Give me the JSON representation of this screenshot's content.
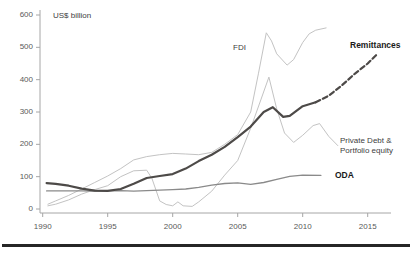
{
  "chart_title": "US$ billion",
  "labels": {
    "fdi": "FDI",
    "remittances": "Remittances",
    "private_debt_line1": "Private Debt &",
    "private_debt_line2": "Portfolio equity",
    "oda": "ODA"
  },
  "colors": {
    "light_series": "#c3c3c3",
    "oda_series": "#8a8a8a",
    "remittances_series": "#4d4a48",
    "axis": "#a6a6a6",
    "tick_text": "#595959",
    "bottom_rule": "#262626"
  },
  "chart_data": {
    "type": "line",
    "title": "US$ billion",
    "xlabel": "",
    "ylabel": "US$ billion",
    "xlim": [
      1989.5,
      2016.5
    ],
    "ylim": [
      0,
      600
    ],
    "y_ticks": [
      0,
      100,
      200,
      300,
      400,
      500,
      600
    ],
    "x_ticks": [
      1990,
      1995,
      2000,
      2005,
      2010,
      2015
    ],
    "grid": false,
    "legend_position": "inline-labels",
    "series": [
      {
        "name": "FDI",
        "style": "solid",
        "color": "#c3c3c3",
        "width": 1,
        "points": [
          [
            1990.4,
            15
          ],
          [
            1991,
            25
          ],
          [
            1992,
            42
          ],
          [
            1993,
            62
          ],
          [
            1994,
            82
          ],
          [
            1995,
            102
          ],
          [
            1996,
            125
          ],
          [
            1997,
            152
          ],
          [
            1998,
            162
          ],
          [
            1999,
            168
          ],
          [
            2000,
            172
          ],
          [
            2001,
            170
          ],
          [
            2002,
            168
          ],
          [
            2003,
            175
          ],
          [
            2004,
            200
          ],
          [
            2005,
            230
          ],
          [
            2006,
            300
          ],
          [
            2006.6,
            420
          ],
          [
            2007.2,
            545
          ],
          [
            2007.6,
            520
          ],
          [
            2008,
            480
          ],
          [
            2008.8,
            445
          ],
          [
            2009.3,
            462
          ],
          [
            2010,
            515
          ],
          [
            2010.5,
            542
          ],
          [
            2011,
            553
          ],
          [
            2011.8,
            560
          ]
        ]
      },
      {
        "name": "Private Debt & Portfolio equity",
        "style": "solid",
        "color": "#c3c3c3",
        "width": 1,
        "points": [
          [
            1990.4,
            10
          ],
          [
            1991,
            15
          ],
          [
            1992,
            28
          ],
          [
            1993,
            46
          ],
          [
            1994,
            60
          ],
          [
            1995,
            72
          ],
          [
            1996,
            100
          ],
          [
            1997,
            118
          ],
          [
            1998,
            120
          ],
          [
            1998.4,
            95
          ],
          [
            1999,
            25
          ],
          [
            1999.5,
            14
          ],
          [
            2000,
            10
          ],
          [
            2000.4,
            22
          ],
          [
            2000.8,
            10
          ],
          [
            2001.5,
            8
          ],
          [
            2002,
            22
          ],
          [
            2003,
            55
          ],
          [
            2004,
            105
          ],
          [
            2005,
            150
          ],
          [
            2006,
            250
          ],
          [
            2006.8,
            340
          ],
          [
            2007.4,
            408
          ],
          [
            2008,
            310
          ],
          [
            2008.6,
            235
          ],
          [
            2009.3,
            206
          ],
          [
            2010,
            228
          ],
          [
            2010.8,
            258
          ],
          [
            2011.3,
            264
          ],
          [
            2012,
            225
          ],
          [
            2012.7,
            196
          ]
        ]
      },
      {
        "name": "ODA",
        "style": "solid",
        "color": "#8a8a8a",
        "width": 1.3,
        "points": [
          [
            1990.3,
            56
          ],
          [
            1991,
            56
          ],
          [
            1992,
            56
          ],
          [
            1993,
            56
          ],
          [
            1994,
            55
          ],
          [
            1995,
            56
          ],
          [
            1996,
            57
          ],
          [
            1997,
            55
          ],
          [
            1998,
            57
          ],
          [
            1999,
            58
          ],
          [
            2000,
            60
          ],
          [
            2001,
            62
          ],
          [
            2002,
            67
          ],
          [
            2003,
            74
          ],
          [
            2004,
            79
          ],
          [
            2005,
            81
          ],
          [
            2006,
            76
          ],
          [
            2007,
            82
          ],
          [
            2008,
            92
          ],
          [
            2009,
            101
          ],
          [
            2010,
            105
          ],
          [
            2011.4,
            104
          ]
        ]
      },
      {
        "name": "Remittances",
        "style": "solid",
        "color": "#4d4a48",
        "width": 2.2,
        "points": [
          [
            1990.3,
            80
          ],
          [
            1991,
            78
          ],
          [
            1992,
            72
          ],
          [
            1993,
            63
          ],
          [
            1994,
            57
          ],
          [
            1995,
            56
          ],
          [
            1996,
            62
          ],
          [
            1997,
            78
          ],
          [
            1998,
            96
          ],
          [
            1999,
            102
          ],
          [
            2000,
            108
          ],
          [
            2001,
            125
          ],
          [
            2002,
            148
          ],
          [
            2003,
            168
          ],
          [
            2004,
            192
          ],
          [
            2005,
            222
          ],
          [
            2006,
            255
          ],
          [
            2007,
            300
          ],
          [
            2007.7,
            315
          ],
          [
            2008.5,
            285
          ],
          [
            2009,
            288
          ],
          [
            2010,
            318
          ],
          [
            2011,
            330
          ]
        ]
      },
      {
        "name": "Remittances (projection)",
        "style": "dashed",
        "color": "#4d4a48",
        "width": 2.2,
        "points": [
          [
            2011,
            330
          ],
          [
            2012,
            350
          ],
          [
            2013,
            382
          ],
          [
            2014,
            418
          ],
          [
            2015,
            450
          ],
          [
            2015.7,
            478
          ]
        ]
      }
    ]
  }
}
